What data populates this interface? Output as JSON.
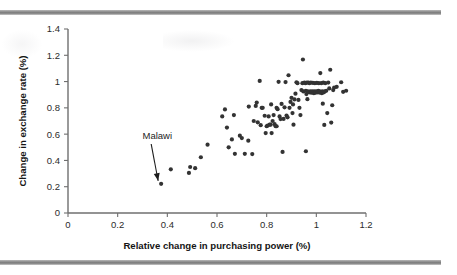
{
  "figure": {
    "background_color": "#ffffff",
    "rule_color": "#8e8e8e",
    "top_rule_name": "top-divider-rule",
    "bottom_rule_name": "bottom-divider-rule"
  },
  "chart_data": {
    "type": "scatter",
    "title": "",
    "subtitle": "",
    "xlabel": "Relative change in purchasing power (%)",
    "ylabel": "Change in exchange rate (%)",
    "xlim": [
      0,
      1.2
    ],
    "ylim": [
      0,
      1.4
    ],
    "xticks": [
      0,
      0.2,
      0.4,
      0.6,
      0.8,
      1,
      1.2
    ],
    "xtick_labels": [
      "0",
      "0.2",
      "0.4",
      "0.6",
      "0.8",
      "1",
      "1.2"
    ],
    "yticks": [
      0,
      0.2,
      0.4,
      0.6,
      0.8,
      1,
      1.2,
      1.4
    ],
    "ytick_labels": [
      "0",
      "0.2",
      "0.4",
      "0.6",
      "0.8",
      "1",
      "1.2",
      "1.4"
    ],
    "grid": false,
    "legend": false,
    "marker_color": "#333333",
    "marker_size": 2.1,
    "annotations": [
      {
        "text": "Malawi",
        "text_x": 0.3,
        "text_y": 0.565,
        "arrow_from_x": 0.335,
        "arrow_from_y": 0.525,
        "arrow_to_x": 0.363,
        "arrow_to_y": 0.245
      }
    ],
    "points": [
      [
        0.375,
        0.222
      ],
      [
        0.414,
        0.332
      ],
      [
        0.487,
        0.305
      ],
      [
        0.492,
        0.35
      ],
      [
        0.512,
        0.341
      ],
      [
        0.535,
        0.424
      ],
      [
        0.562,
        0.52
      ],
      [
        0.621,
        0.735
      ],
      [
        0.632,
        0.788
      ],
      [
        0.64,
        0.65
      ],
      [
        0.647,
        0.5
      ],
      [
        0.66,
        0.56
      ],
      [
        0.668,
        0.745
      ],
      [
        0.672,
        0.45
      ],
      [
        0.692,
        0.588
      ],
      [
        0.7,
        0.57
      ],
      [
        0.712,
        0.45
      ],
      [
        0.726,
        0.55
      ],
      [
        0.742,
        0.448
      ],
      [
        0.748,
        0.7
      ],
      [
        0.756,
        0.815
      ],
      [
        0.76,
        0.84
      ],
      [
        0.764,
        0.69
      ],
      [
        0.772,
        1.005
      ],
      [
        0.776,
        0.668
      ],
      [
        0.78,
        0.8
      ],
      [
        0.784,
        0.8
      ],
      [
        0.792,
        0.74
      ],
      [
        0.796,
        0.608
      ],
      [
        0.8,
        0.66
      ],
      [
        0.804,
        0.665
      ],
      [
        0.808,
        0.735
      ],
      [
        0.812,
        0.672
      ],
      [
        0.816,
        0.672
      ],
      [
        0.818,
        0.826
      ],
      [
        0.82,
        0.608
      ],
      [
        0.824,
        0.7
      ],
      [
        0.828,
        0.745
      ],
      [
        0.832,
        0.676
      ],
      [
        0.836,
        0.66
      ],
      [
        0.84,
        0.8
      ],
      [
        0.844,
        0.79
      ],
      [
        0.848,
        0.998
      ],
      [
        0.852,
        0.735
      ],
      [
        0.856,
        0.715
      ],
      [
        0.86,
        0.83
      ],
      [
        0.864,
        0.465
      ],
      [
        0.868,
        0.716
      ],
      [
        0.872,
        0.804
      ],
      [
        0.876,
        0.996
      ],
      [
        0.88,
        0.742
      ],
      [
        0.884,
        0.728
      ],
      [
        0.888,
        1.048
      ],
      [
        0.892,
        0.8
      ],
      [
        0.896,
        0.845
      ],
      [
        0.9,
        0.876
      ],
      [
        0.904,
        0.76
      ],
      [
        0.908,
        0.672
      ],
      [
        0.912,
        0.864
      ],
      [
        0.916,
        0.908
      ],
      [
        0.92,
        0.995
      ],
      [
        0.924,
        0.988
      ],
      [
        0.928,
        0.86
      ],
      [
        0.932,
        0.8
      ],
      [
        0.936,
        0.745
      ],
      [
        0.94,
        0.935
      ],
      [
        0.944,
        0.988
      ],
      [
        0.946,
        1.168
      ],
      [
        0.948,
        0.925
      ],
      [
        0.952,
        0.992
      ],
      [
        0.956,
        0.988
      ],
      [
        0.958,
        0.93
      ],
      [
        0.96,
        0.905
      ],
      [
        0.962,
        0.992
      ],
      [
        0.964,
        0.866
      ],
      [
        0.966,
        0.925
      ],
      [
        0.968,
        0.992
      ],
      [
        0.97,
        0.92
      ],
      [
        0.972,
        0.988
      ],
      [
        0.974,
        0.918
      ],
      [
        0.976,
        0.925
      ],
      [
        0.978,
        0.992
      ],
      [
        0.98,
        0.915
      ],
      [
        0.982,
        0.92
      ],
      [
        0.984,
        0.925
      ],
      [
        0.986,
        0.99
      ],
      [
        0.988,
        0.918
      ],
      [
        0.99,
        0.912
      ],
      [
        0.992,
        0.925
      ],
      [
        0.994,
        0.988
      ],
      [
        0.996,
        0.92
      ],
      [
        0.998,
        0.916
      ],
      [
        1.0,
        0.925
      ],
      [
        1.002,
        0.99
      ],
      [
        1.004,
        0.918
      ],
      [
        1.006,
        0.922
      ],
      [
        1.008,
        0.93
      ],
      [
        1.01,
        0.988
      ],
      [
        1.012,
        0.916
      ],
      [
        1.014,
        0.925
      ],
      [
        1.016,
        1.065
      ],
      [
        1.018,
        0.92
      ],
      [
        1.02,
        0.988
      ],
      [
        1.022,
        0.912
      ],
      [
        1.024,
        0.925
      ],
      [
        1.026,
        0.832
      ],
      [
        1.028,
        0.992
      ],
      [
        1.03,
        0.918
      ],
      [
        1.032,
        0.67
      ],
      [
        1.034,
        0.925
      ],
      [
        1.036,
        0.988
      ],
      [
        1.04,
        0.93
      ],
      [
        1.044,
        0.76
      ],
      [
        1.048,
        0.992
      ],
      [
        1.052,
        0.948
      ],
      [
        1.056,
        1.09
      ],
      [
        1.06,
        0.688
      ],
      [
        1.064,
        0.82
      ],
      [
        1.068,
        0.935
      ],
      [
        1.072,
        0.955
      ],
      [
        1.082,
        0.96
      ],
      [
        1.1,
        0.995
      ],
      [
        1.108,
        0.922
      ],
      [
        1.12,
        0.93
      ],
      [
        0.958,
        0.47
      ],
      [
        0.84,
        0.66
      ],
      [
        0.728,
        0.81
      ],
      [
        0.906,
        0.826
      ]
    ]
  }
}
